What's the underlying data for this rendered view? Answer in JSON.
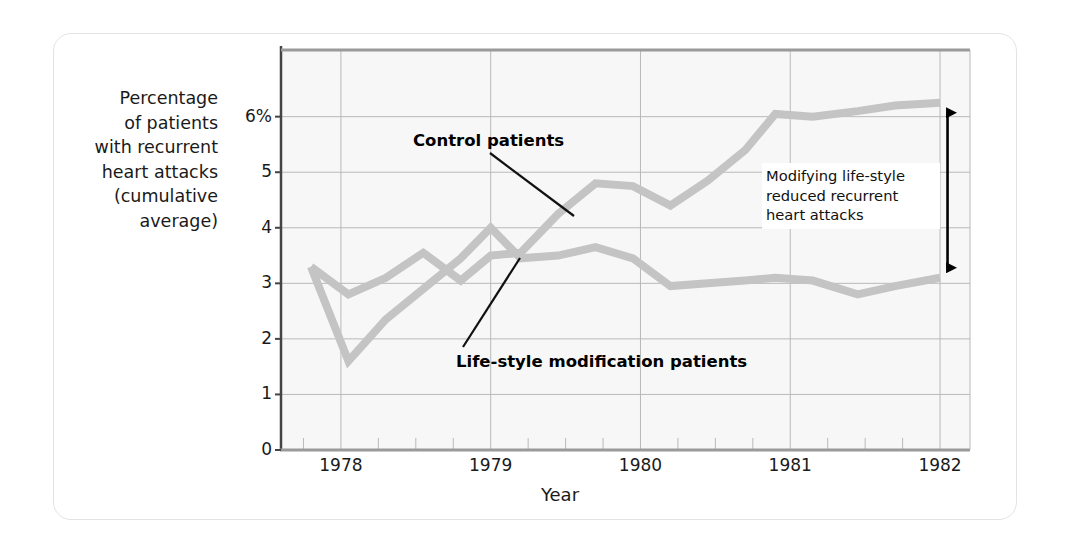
{
  "figure": {
    "y_axis_title": "Percentage\nof patients\nwith recurrent\nheart attacks\n(cumulative\naverage)",
    "x_axis_title": "Year",
    "series_labels": {
      "control": "Control patients",
      "lifestyle": "Life-style modification patients"
    },
    "annotation": "Modifying life-style\nreduced recurrent\nheart attacks",
    "colors": {
      "line": "#c4c4c4",
      "grid": "#b9b9b9",
      "axis": "#9a9a9a",
      "plot_bg": "#f7f7f7",
      "text": "#1a1a1a",
      "arrow": "#000000",
      "card_border": "#e3e3e3"
    }
  },
  "chart_data": {
    "type": "line",
    "title": "",
    "xlabel": "Year",
    "ylabel": "Percentage of patients with recurrent heart attacks (cumulative average)",
    "xlim": [
      1977.6,
      1982.2
    ],
    "ylim": [
      0,
      7.2
    ],
    "xticks": [
      "1978",
      "1979",
      "1980",
      "1981",
      "1982"
    ],
    "xtick_values": [
      1978,
      1979,
      1980,
      1981,
      1982
    ],
    "yticks": [
      "0",
      "1",
      "2",
      "3",
      "4",
      "5",
      "6%"
    ],
    "ytick_values": [
      0,
      1,
      2,
      3,
      4,
      5,
      6
    ],
    "minor_xticks_per_year": 4,
    "grid": true,
    "legend": "callout-labels",
    "series": [
      {
        "name": "Control patients",
        "x": [
          1977.8,
          1978.05,
          1978.3,
          1978.55,
          1978.8,
          1979.0,
          1979.2,
          1979.45,
          1979.7,
          1979.95,
          1980.2,
          1980.45,
          1980.7,
          1980.9,
          1981.15,
          1981.45,
          1981.7,
          1982.0
        ],
        "values": [
          3.3,
          2.8,
          3.1,
          3.55,
          3.05,
          3.5,
          3.55,
          4.25,
          4.8,
          4.75,
          4.4,
          4.85,
          5.4,
          6.05,
          6.0,
          6.1,
          6.2,
          6.25
        ]
      },
      {
        "name": "Life-style modification patients",
        "x": [
          1977.8,
          1978.05,
          1978.3,
          1978.55,
          1978.8,
          1979.0,
          1979.2,
          1979.45,
          1979.7,
          1979.95,
          1980.2,
          1980.45,
          1980.7,
          1980.9,
          1981.15,
          1981.45,
          1981.7,
          1982.0
        ],
        "values": [
          3.3,
          1.6,
          2.35,
          2.9,
          3.45,
          4.0,
          3.45,
          3.5,
          3.65,
          3.45,
          2.95,
          3.0,
          3.05,
          3.1,
          3.05,
          2.8,
          2.95,
          3.1
        ]
      }
    ],
    "annotation_arrow": {
      "label": "Modifying life-style reduced recurrent heart attacks",
      "x": 1982.05,
      "y_top": 6.25,
      "y_bottom": 3.1
    }
  }
}
